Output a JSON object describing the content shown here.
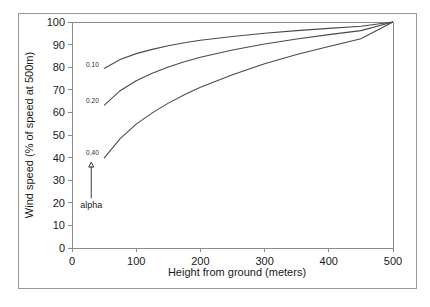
{
  "chart_data": {
    "type": "line",
    "title": "",
    "xlabel": "Height from ground (meters)",
    "ylabel": "Wind speed (% of speed at 500m)",
    "xlim": [
      0,
      500
    ],
    "ylim": [
      0,
      100
    ],
    "xticks": [
      "0",
      "100",
      "200",
      "300",
      "400",
      "500"
    ],
    "yticks": [
      "0",
      "10",
      "20",
      "30",
      "40",
      "50",
      "60",
      "70",
      "80",
      "90",
      "100"
    ],
    "grid": false,
    "legend_position": "inline-curve-labels",
    "annotations": [
      {
        "text": "alpha",
        "x": 30,
        "y": 22,
        "arrow_to_y": 38
      }
    ],
    "series": [
      {
        "name": "0.10",
        "label": "0.10",
        "label_x": 22,
        "label_y": 80,
        "x": [
          50,
          75,
          100,
          125,
          150,
          175,
          200,
          250,
          300,
          350,
          400,
          450,
          500
        ],
        "values": [
          79.4,
          83.4,
          86.0,
          87.9,
          89.5,
          90.8,
          91.9,
          93.6,
          95.0,
          96.2,
          97.2,
          98.1,
          100.0
        ]
      },
      {
        "name": "0.20",
        "label": "0.20",
        "label_x": 22,
        "label_y": 64,
        "x": [
          50,
          75,
          100,
          125,
          150,
          175,
          200,
          250,
          300,
          350,
          400,
          450,
          500
        ],
        "values": [
          63.1,
          69.6,
          74.0,
          77.3,
          80.1,
          82.4,
          84.4,
          87.6,
          90.3,
          92.5,
          94.4,
          96.2,
          100.0
        ]
      },
      {
        "name": "0.40",
        "label": "0.40",
        "label_x": 22,
        "label_y": 41,
        "x": [
          50,
          75,
          100,
          125,
          150,
          175,
          200,
          250,
          300,
          350,
          400,
          450,
          500
        ],
        "values": [
          39.8,
          48.4,
          54.8,
          59.8,
          64.1,
          67.8,
          71.1,
          76.7,
          81.5,
          85.6,
          89.2,
          92.6,
          100.0
        ]
      }
    ]
  }
}
